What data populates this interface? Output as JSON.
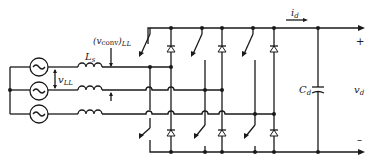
{
  "diagram": {
    "type": "circuit-schematic",
    "labels": {
      "source_inductance": "L",
      "source_inductance_sub": "s",
      "converter_voltage": "(v",
      "converter_voltage_sub": "conv",
      "converter_voltage_close": ")",
      "converter_voltage_ll": "LL",
      "line_voltage": "v",
      "line_voltage_sub": "LL",
      "dc_current": "i",
      "dc_current_sub": "d",
      "capacitor": "C",
      "capacitor_sub": "d",
      "dc_voltage": "v",
      "dc_voltage_sub": "d",
      "plus": "+",
      "minus": "–"
    },
    "sources": [
      "ac-source-a",
      "ac-source-b",
      "ac-source-c"
    ],
    "legs": [
      {
        "name": "leg-1",
        "switch_x": 150,
        "diode_x": 171
      },
      {
        "name": "leg-2",
        "switch_x": 205,
        "diode_x": 222
      },
      {
        "name": "leg-3",
        "switch_x": 255,
        "diode_x": 274
      }
    ]
  }
}
